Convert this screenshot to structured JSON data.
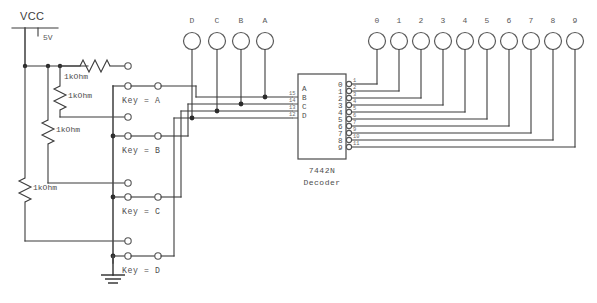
{
  "diagram": {
    "colors": {
      "wire": "#3b3b3b",
      "node": "#2b2b2b",
      "text": "#4d4d4d",
      "background": "#ffffff"
    }
  },
  "power": {
    "vcc_label": "VCC",
    "voltage_label": "5V"
  },
  "resistors": [
    {
      "id": "r1",
      "label": "1kOhm",
      "orientation": "horizontal"
    },
    {
      "id": "r2",
      "label": "1kOhm",
      "orientation": "vertical"
    },
    {
      "id": "r3",
      "label": "1kOhm",
      "orientation": "vertical"
    },
    {
      "id": "r4",
      "label": "1kOhm",
      "orientation": "vertical"
    }
  ],
  "switches": [
    {
      "id": "sw-a",
      "label": "Key = A"
    },
    {
      "id": "sw-b",
      "label": "Key = B"
    },
    {
      "id": "sw-c",
      "label": "Key = C"
    },
    {
      "id": "sw-d",
      "label": "Key = D"
    }
  ],
  "input_probes": [
    {
      "id": "probe-d",
      "label": "D"
    },
    {
      "id": "probe-c",
      "label": "C"
    },
    {
      "id": "probe-b",
      "label": "B"
    },
    {
      "id": "probe-a",
      "label": "A"
    }
  ],
  "output_probes": [
    {
      "id": "probe-0",
      "label": "0"
    },
    {
      "id": "probe-1",
      "label": "1"
    },
    {
      "id": "probe-2",
      "label": "2"
    },
    {
      "id": "probe-3",
      "label": "3"
    },
    {
      "id": "probe-4",
      "label": "4"
    },
    {
      "id": "probe-5",
      "label": "5"
    },
    {
      "id": "probe-6",
      "label": "6"
    },
    {
      "id": "probe-7",
      "label": "7"
    },
    {
      "id": "probe-8",
      "label": "8"
    },
    {
      "id": "probe-9",
      "label": "9"
    }
  ],
  "ic": {
    "part_number": "7442N",
    "description": "Decoder",
    "input_ports": [
      {
        "name": "A",
        "pin": "15"
      },
      {
        "name": "B",
        "pin": "14"
      },
      {
        "name": "C",
        "pin": "13"
      },
      {
        "name": "D",
        "pin": "12"
      }
    ],
    "output_ports": [
      {
        "name": "0",
        "pin": "1"
      },
      {
        "name": "1",
        "pin": "2"
      },
      {
        "name": "2",
        "pin": "3"
      },
      {
        "name": "3",
        "pin": "4"
      },
      {
        "name": "4",
        "pin": "5"
      },
      {
        "name": "5",
        "pin": "6"
      },
      {
        "name": "6",
        "pin": "7"
      },
      {
        "name": "7",
        "pin": "9"
      },
      {
        "name": "8",
        "pin": "10"
      },
      {
        "name": "9",
        "pin": "11"
      }
    ]
  },
  "ground": {
    "label": ""
  }
}
